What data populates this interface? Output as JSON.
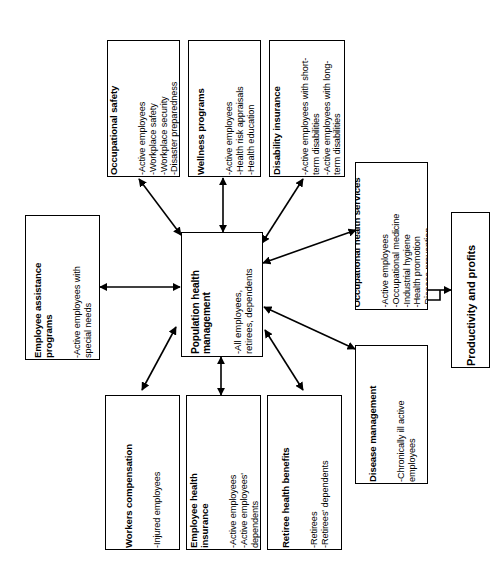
{
  "diagram": {
    "orientation": "rotated-90-ccw",
    "type": "flowchart",
    "background_color": "#ffffff",
    "line_color": "#000000",
    "nodes": [
      {
        "id": "occupational-safety",
        "title": "Occupational safety",
        "items": "-Active employees\n-Workplace safety\n-Workplace security\n-Disaster preparedness"
      },
      {
        "id": "wellness-programs",
        "title": "Wellness programs",
        "items": "-Active employees\n-Health risk appraisals\n-Health education"
      },
      {
        "id": "disability-insurance",
        "title": "Disability insurance",
        "items": "-Active employees with short-\nterm disabilities\n-Active employees with long-\nterm disabilities"
      },
      {
        "id": "occupational-health-services",
        "title": "Occupational health services",
        "items": "-Active employees\n-Occupational medicine\n-Industrial hygiene\n-Health promotion\n-Disease prevention"
      },
      {
        "id": "employee-assistance-programs",
        "title": "Employee assistance\nprograms",
        "items": "-Active employees with\nspecial needs"
      },
      {
        "id": "population-health-management",
        "title": "Population health\nmanagement",
        "items": "-All employees,\nretirees, dependents"
      },
      {
        "id": "productivity-and-profits",
        "title": "Productivity and profits",
        "items": ""
      },
      {
        "id": "workers-compensation",
        "title": "Workers compensation",
        "items": "-Injured employees"
      },
      {
        "id": "employee-health-insurance",
        "title": "Employee health\ninsurance",
        "items": "-Active employees\n-Active employees'\ndependents"
      },
      {
        "id": "retiree-health-benefits",
        "title": "Retiree health benefits",
        "items": "-Retirees\n-Retirees' dependents"
      },
      {
        "id": "disease-management",
        "title": "Disease management",
        "items": "-Chronically ill active\nemployees"
      }
    ]
  }
}
